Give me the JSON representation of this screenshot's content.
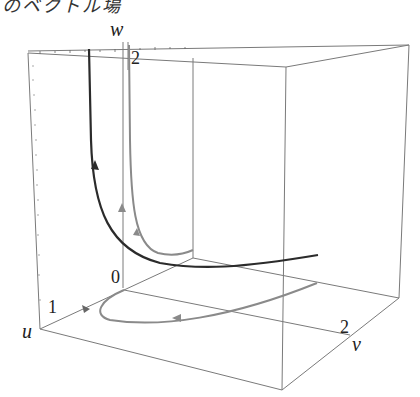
{
  "caption": "のベクトル場",
  "axes": {
    "u": {
      "label": "u",
      "tick": "1"
    },
    "v": {
      "label": "v",
      "tick": "2"
    },
    "w": {
      "label": "w",
      "tick": "2"
    },
    "origin": "0"
  },
  "colors": {
    "box": "#777777",
    "dark_curve": "#2b2b2b",
    "gray_curve": "#8a8a8a",
    "background": "#ffffff"
  },
  "curves": [
    {
      "name": "dark-trajectory",
      "description": "rises vertically near back-left, bends and runs right along floor"
    },
    {
      "name": "gray-trajectory-upper",
      "description": "vertical gray curve near w-axis bending into floor"
    },
    {
      "name": "gray-trajectory-floor",
      "description": "loop on the floor plane with arrows"
    }
  ]
}
